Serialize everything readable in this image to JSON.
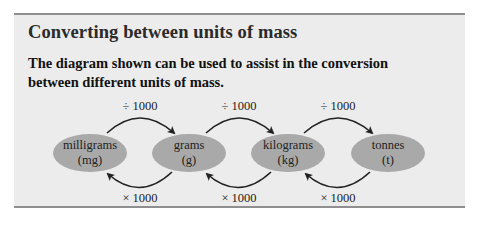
{
  "panel": {
    "title": "Converting between units of mass",
    "description": "The diagram shown can be used to assist in the conversion between different units of mass."
  },
  "diagram": {
    "units": [
      {
        "name": "milligrams",
        "abbr": "(mg)"
      },
      {
        "name": "grams",
        "abbr": "(g)"
      },
      {
        "name": "kilograms",
        "abbr": "(kg)"
      },
      {
        "name": "tonnes",
        "abbr": "(t)"
      }
    ],
    "forward_labels": [
      "÷ 1000",
      "÷ 1000",
      "÷ 1000"
    ],
    "backward_labels": [
      "× 1000",
      "× 1000",
      "× 1000"
    ]
  },
  "colors": {
    "panel_bg": "#ececec",
    "panel_border": "#8f8f8f",
    "ellipse_fill": "#a9a9a9",
    "arrow": "#222222"
  }
}
